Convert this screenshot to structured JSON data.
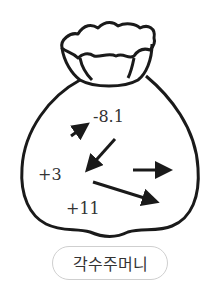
{
  "figure": {
    "numbers": [
      "-8.1",
      "+3",
      "+11"
    ],
    "pouch_label": "각수주머니",
    "stroke_color": "#1a1a1a"
  }
}
